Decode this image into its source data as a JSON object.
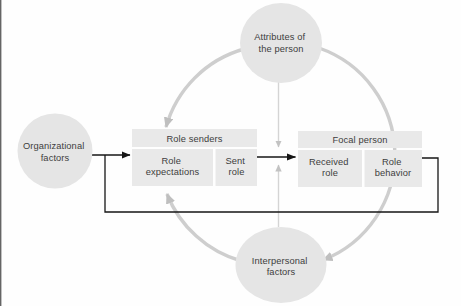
{
  "figure": {
    "nodes": {
      "attributes": {
        "line1": "Attributes of",
        "line2": "the person"
      },
      "organizational": {
        "line1": "Organizational",
        "line2": "factors"
      },
      "interpersonal": {
        "line1": "Interpersonal",
        "line2": "factors"
      }
    },
    "role_senders": {
      "title": "Role senders",
      "left_cell": {
        "line1": "Role",
        "line2": "expectations"
      },
      "right_cell": {
        "line1": "Sent",
        "line2": "role"
      }
    },
    "focal_person": {
      "title": "Focal person",
      "left_cell": {
        "line1": "Received",
        "line2": "role"
      },
      "right_cell": {
        "line1": "Role",
        "line2": "behavior"
      }
    },
    "colors": {
      "node_fill": "#e5e5e5",
      "box_fill": "#e9e9e9",
      "arc_stroke": "#c9c9c9",
      "thin_gray_stroke": "#d4d4d4",
      "black_line": "#161616",
      "text": "#3d3d3d",
      "scan_edge": "#4a4a4a"
    }
  }
}
